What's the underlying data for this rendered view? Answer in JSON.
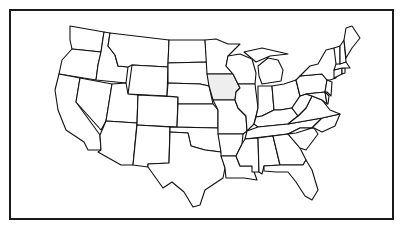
{
  "map": {
    "title": "United States",
    "highlighted_state": "Iowa",
    "highlight_color": "#eeeeee",
    "outline_color": "#111111",
    "states": [
      {
        "id": "WA",
        "name": "Washington",
        "d": "M70,26 L104,32 L101,52 L82,50 L72,49 L70,40 Z"
      },
      {
        "id": "OR",
        "name": "Oregon",
        "d": "M72,49 L82,50 L101,52 L98,65 L96,80 L59,74 L62,60 Z"
      },
      {
        "id": "CA",
        "name": "California",
        "d": "M59,74 L80,78 L76,102 L100,135 L101,150 L88,150 L84,142 L66,130 L58,110 L55,90 Z"
      },
      {
        "id": "ID",
        "name": "Idaho",
        "d": "M104,32 L110,33 L108,46 L115,55 L118,66 L128,67 L126,83 L96,80 L98,65 L101,52 Z"
      },
      {
        "id": "NV",
        "name": "Nevada",
        "d": "M80,78 L112,84 L106,121 L101,130 L76,102 Z"
      },
      {
        "id": "MT",
        "name": "Montana",
        "d": "M110,33 L169,40 L168,67 L132,65 L128,67 L118,66 L115,55 L108,46 Z"
      },
      {
        "id": "WY",
        "name": "Wyoming",
        "d": "M132,65 L168,67 L167,96 L128,94 Z"
      },
      {
        "id": "UT",
        "name": "Utah",
        "d": "M112,84 L126,83 L128,94 L138,95 L137,123 L106,121 Z"
      },
      {
        "id": "AZ",
        "name": "Arizona",
        "d": "M106,121 L137,123 L133,165 L121,165 L98,152 L101,150 L100,135 Z"
      },
      {
        "id": "CO",
        "name": "Colorado",
        "d": "M138,95 L178,97 L177,127 L137,125 Z"
      },
      {
        "id": "NM",
        "name": "New Mexico",
        "d": "M137,125 L170,127 L169,163 L148,164 L148,167 L133,165 Z"
      },
      {
        "id": "ND",
        "name": "North Dakota",
        "d": "M169,40 L205,40 L207,62 L168,63 Z"
      },
      {
        "id": "SD",
        "name": "South Dakota",
        "d": "M168,63 L207,62 L209,86 L200,84 L168,83 Z"
      },
      {
        "id": "NE",
        "name": "Nebraska",
        "d": "M168,83 L200,84 L209,86 L213,104 L178,104 L178,97 L167,96 Z"
      },
      {
        "id": "KS",
        "name": "Kansas",
        "d": "M178,104 L213,104 L218,110 L218,128 L177,127 Z"
      },
      {
        "id": "OK",
        "name": "Oklahoma",
        "d": "M170,127 L218,128 L221,152 L205,150 L191,146 L188,133 L170,132 Z"
      },
      {
        "id": "TX",
        "name": "Texas",
        "d": "M170,132 L188,133 L191,146 L205,150 L221,152 L225,168 L223,178 L205,190 L200,205 L193,207 L184,192 L172,182 L163,188 L148,167 L148,164 L169,163 Z"
      },
      {
        "id": "MN",
        "name": "Minnesota",
        "d": "M205,40 L216,39 L228,44 L240,44 L228,56 L226,66 L233,74 L207,74 Z"
      },
      {
        "id": "IA",
        "name": "Iowa",
        "d": "M207,74 L233,74 L237,82 L240,88 L236,92 L235,100 L213,100 L209,86 Z"
      },
      {
        "id": "MO",
        "name": "Missouri",
        "d": "M213,100 L235,100 L238,108 L246,116 L247,131 L243,134 L218,134 L218,110 Z"
      },
      {
        "id": "AR",
        "name": "Arkansas",
        "d": "M218,134 L243,134 L242,144 L236,156 L221,156 L221,152 Z"
      },
      {
        "id": "LA",
        "name": "Louisiana",
        "d": "M221,156 L236,156 L240,166 L252,166 L257,180 L244,178 L226,178 L225,168 Z"
      },
      {
        "id": "WI",
        "name": "Wisconsin",
        "d": "M228,56 L240,54 L252,59 L256,73 L255,84 L238,84 L233,74 L226,66 Z"
      },
      {
        "id": "IL",
        "name": "Illinois",
        "d": "M238,84 L255,84 L258,108 L254,124 L247,131 L246,116 L238,108 L235,100 L236,92 L240,88 Z"
      },
      {
        "id": "MI",
        "name": "Michigan",
        "d": "M258,66 L268,58 L278,60 L283,70 L281,81 L262,84 L259,76 Z M244,52 L262,48 L288,54 L270,56 L256,62 Z"
      },
      {
        "id": "IN",
        "name": "Indiana",
        "d": "M258,86 L272,86 L274,110 L262,116 L256,117 L258,108 Z"
      },
      {
        "id": "OH",
        "name": "Ohio",
        "d": "M272,86 L284,84 L296,80 L300,96 L292,108 L280,110 L274,110 Z"
      },
      {
        "id": "KY",
        "name": "Kentucky",
        "d": "M254,124 L256,117 L262,116 L274,110 L280,110 L292,108 L298,116 L288,124 L258,127 Z"
      },
      {
        "id": "TN",
        "name": "Tennessee",
        "d": "M247,131 L258,127 L288,124 L322,118 L312,128 L296,133 L245,139 Z"
      },
      {
        "id": "MS",
        "name": "Mississippi",
        "d": "M245,139 L258,138 L259,172 L252,172 L252,166 L240,166 L236,156 L242,144 Z"
      },
      {
        "id": "AL",
        "name": "Alabama",
        "d": "M258,138 L273,136 L280,165 L264,166 L262,174 L259,172 Z"
      },
      {
        "id": "GA",
        "name": "Georgia",
        "d": "M273,136 L288,134 L300,148 L306,160 L303,165 L280,165 Z"
      },
      {
        "id": "FL",
        "name": "Florida",
        "d": "M264,166 L280,165 L303,165 L306,160 L312,170 L318,190 L312,200 L305,196 L296,182 L288,172 L276,172 L264,171 Z"
      },
      {
        "id": "SC",
        "name": "South Carolina",
        "d": "M288,134 L300,128 L314,128 L318,134 L306,150 L300,148 Z"
      },
      {
        "id": "NC",
        "name": "North Carolina",
        "d": "M296,133 L312,128 L322,118 L340,114 L335,126 L322,132 L314,128 L300,128 L288,134 Z"
      },
      {
        "id": "VA",
        "name": "Virginia",
        "d": "M288,124 L298,116 L306,108 L312,96 L322,100 L330,110 L340,114 L322,118 Z"
      },
      {
        "id": "WV",
        "name": "West Virginia",
        "d": "M292,108 L300,96 L306,94 L312,96 L306,108 L298,116 Z"
      },
      {
        "id": "PA",
        "name": "Pennsylvania",
        "d": "M296,80 L300,76 L322,74 L327,80 L325,92 L306,94 L300,96 Z"
      },
      {
        "id": "NY",
        "name": "New York",
        "d": "M300,76 L310,66 L318,64 L326,50 L334,48 L338,62 L336,78 L330,80 L327,80 L322,74 Z"
      },
      {
        "id": "MD",
        "name": "Maryland",
        "d": "M306,94 L325,92 L327,104 L322,100 L312,96 Z"
      },
      {
        "id": "DE",
        "name": "Delaware",
        "d": "M325,92 L329,96 L328,104 L327,104 Z"
      },
      {
        "id": "NJ",
        "name": "New Jersey",
        "d": "M327,80 L332,82 L331,96 L327,92 L325,92 Z"
      },
      {
        "id": "CT",
        "name": "Connecticut",
        "d": "M334,70 L342,68 L342,74 L334,78 Z"
      },
      {
        "id": "RI",
        "name": "Rhode Island",
        "d": "M342,68 L345,68 L345,73 L342,74 Z"
      },
      {
        "id": "MA",
        "name": "Massachusetts",
        "d": "M336,64 L346,62 L350,68 L345,68 L342,68 L334,70 Z"
      },
      {
        "id": "VT",
        "name": "Vermont",
        "d": "M334,48 L340,46 L340,64 L336,64 Z"
      },
      {
        "id": "NH",
        "name": "New Hampshire",
        "d": "M340,46 L344,40 L346,62 L340,64 Z"
      },
      {
        "id": "ME",
        "name": "Maine",
        "d": "M344,40 L346,28 L352,26 L360,38 L352,48 L346,58 Z"
      }
    ]
  }
}
